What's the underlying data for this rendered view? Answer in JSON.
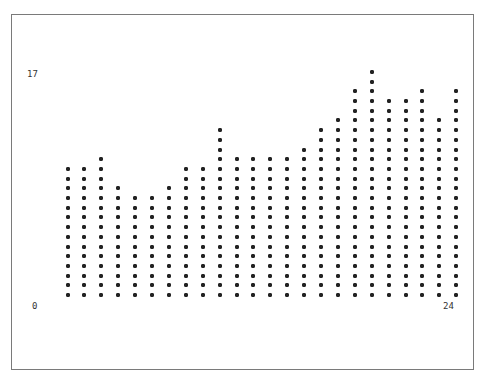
{
  "chart_data": {
    "type": "bar",
    "style": "asterisk-column (text plot)",
    "title": "",
    "xlabel": "",
    "ylabel": "",
    "x_axis": {
      "min_label": "0",
      "max_label": "24"
    },
    "y_axis": {
      "min_label": "0",
      "max_label": "17"
    },
    "categories": [
      1,
      2,
      3,
      4,
      5,
      6,
      7,
      8,
      9,
      10,
      11,
      12,
      13,
      14,
      15,
      16,
      17,
      18,
      19,
      20,
      21,
      22,
      23,
      24
    ],
    "star_counts": [
      14,
      14,
      15,
      12,
      11,
      11,
      12,
      14,
      14,
      18,
      15,
      15,
      15,
      15,
      16,
      18,
      19,
      22,
      24,
      21,
      21,
      22,
      19,
      22
    ],
    "values": [
      9.9,
      9.9,
      10.6,
      8.5,
      7.8,
      7.8,
      8.5,
      9.9,
      9.9,
      12.8,
      10.6,
      10.6,
      10.6,
      10.6,
      11.3,
      12.8,
      13.5,
      15.6,
      17.0,
      14.9,
      14.9,
      15.6,
      13.5,
      15.6
    ],
    "ylim": [
      0,
      17
    ],
    "grid": false,
    "legend": null,
    "marker": "*"
  },
  "labels": {
    "y_max": "17",
    "y_min": "0",
    "x_max": "24"
  },
  "layout": {
    "col_x_start": 67.5,
    "col_x_step": 16.9,
    "row_y_bottom": 295,
    "row_y_step": 9.7
  }
}
